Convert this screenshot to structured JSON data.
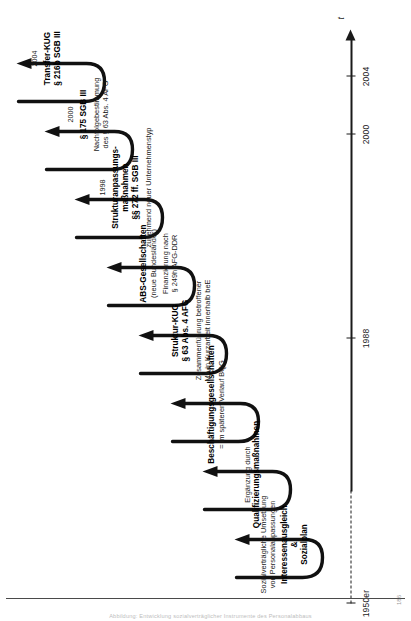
{
  "figure": {
    "type": "timeline",
    "orientation": "rotated-90-ccw",
    "axis": {
      "time_symbol": "t",
      "ticks": [
        {
          "label": "1950er",
          "pos": 0.0,
          "style": "dashed-start"
        },
        {
          "label": "1988",
          "pos": 0.455
        },
        {
          "label": "2000",
          "pos": 0.805
        },
        {
          "label": "2004",
          "pos": 0.905
        }
      ]
    },
    "stages": [
      {
        "id": "interessenausgleich",
        "year": "",
        "sub_top": [
          "Sozialverträgliche Umsetzung",
          "von Personalanpassungen"
        ],
        "heading": [
          "Interessenausgleich",
          "&",
          "Sozialplan"
        ],
        "sub_bottom": []
      },
      {
        "id": "qualifizierung",
        "year": "",
        "sub_top": [
          "Ergänzung durch"
        ],
        "heading": [
          "Qualifizierungsmaßnahmen"
        ],
        "sub_bottom": []
      },
      {
        "id": "beschaeftigungsgesellschaften",
        "year": "",
        "sub_top": [],
        "heading": [
          "Beschäftigungsgesellschaften"
        ],
        "sub_bottom": [
          "= im späteren Verlauf BQG"
        ]
      },
      {
        "id": "struktur-kug",
        "year": "",
        "sub_top": [],
        "heading": [
          "Struktur-KUG",
          "§ 63 Abs. 4 AFG"
        ],
        "sub_bottom": [
          "Zusammenführung betroffener",
          "MA in Kurzarbeit innerhalb beE"
        ]
      },
      {
        "id": "abs-gesellschaften",
        "year": "",
        "sub_top": [],
        "heading": [
          "ABS-Gesellschaften"
        ],
        "sub_mid": [
          "(neue Bundesländer)"
        ],
        "sub_bottom": [
          "Finanzierung nach",
          "§ 249h AFG-DDR"
        ]
      },
      {
        "id": "strukturanpassungsmassnahmen",
        "year": "1998",
        "sub_top": [],
        "heading": [
          "Strukturanpassungs-",
          "maßnahmen",
          "§§ 272 ff. SGB III"
        ],
        "sub_bottom": [
          "zunehmend neuer Unternehmenstyp"
        ]
      },
      {
        "id": "paragraph-175-sgb-iii",
        "year": "2000",
        "sub_top": [],
        "heading": [
          "§ 175 SGB III"
        ],
        "sub_bottom": [
          "Nachfolgebestimmung",
          "des § 63 Abs. 4 AFG"
        ]
      },
      {
        "id": "transfer-kug",
        "year": "2004",
        "sub_top": [],
        "heading": [
          "Transfer-KUG",
          "§ 216b SGB III"
        ],
        "sub_bottom": []
      }
    ]
  },
  "page": {
    "caption": "Abbildung: Entwicklung sozialverträglicher Instrumente des Personalabbaus",
    "folio": "186"
  },
  "colors": {
    "ink": "#111111",
    "axis": "#1a1a1a",
    "rule": "#4a4a4a",
    "caption": "#bdbdbd"
  }
}
